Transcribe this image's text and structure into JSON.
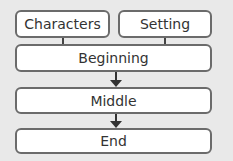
{
  "diagram": {
    "top_boxes": [
      {
        "label": "Characters"
      },
      {
        "label": "Setting"
      }
    ],
    "sequence": [
      {
        "label": "Beginning"
      },
      {
        "label": "Middle"
      },
      {
        "label": "End"
      }
    ]
  }
}
